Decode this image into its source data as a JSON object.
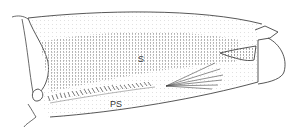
{
  "figure": {
    "labels": {
      "s": "S",
      "ps": "PS"
    },
    "colors": {
      "line": "#444444",
      "stipple": "#9a9a9a",
      "background": "#ffffff"
    }
  }
}
